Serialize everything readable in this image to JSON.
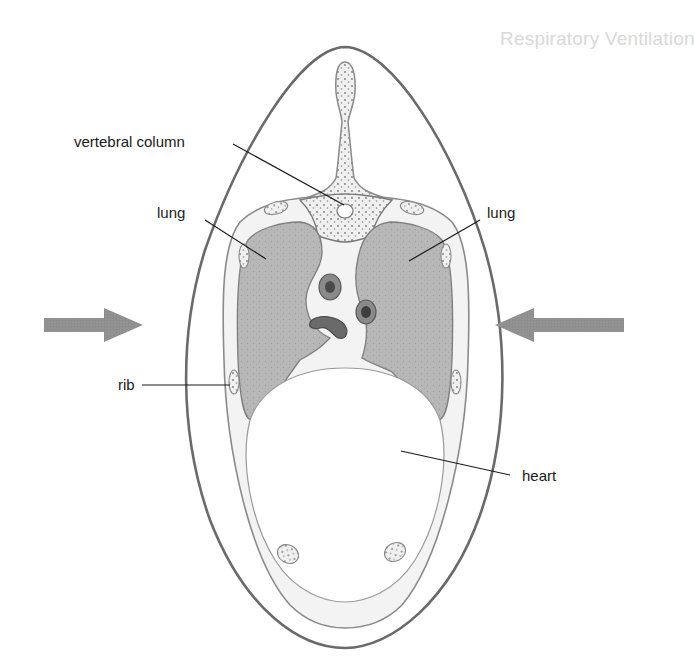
{
  "figure": {
    "labels": {
      "vertebral_column": "vertebral column",
      "lung_left": "lung",
      "lung_right": "lung",
      "rib": "rib",
      "heart": "heart"
    },
    "arrows": [
      {
        "name": "left-arrow",
        "direction": "right",
        "color": "#8c8c8c"
      },
      {
        "name": "right-arrow",
        "direction": "left",
        "color": "#8c8c8c"
      }
    ],
    "colors": {
      "outline": "#6e6e6e",
      "lung_fill": "#b9b9b9",
      "bone_fill": "#ececec",
      "arrow": "#8c8c8c",
      "leader_line": "#1a1a1a"
    }
  },
  "background_text": {
    "heading": "Respiratory Ventilation",
    "lines": [
      "This system is of the involuntary type — it is kept out",
      "...mechanical movement without conscious effort. It is not",
      "...conscious voluntary control, however, using the",
      "...range of smaller muscles...",
      "...is merely...",
      "During birth, the ... blood from the",
      "placenta is cut ... oxygen in the foetal",
      "system ... carbon dioxide until it causes a",
      "the level of carbon dioxide ... until it causes a",
      "marked change in pH of the blood. This increase",
      "acidity is recognised by the respiratory centre in the",
      "brain, which sends a series of impulses which produce",
      "inspiration and subsequent expiration then on. The",
      "...volume of respiration is controlled mainly from",
      "... through the autonomic nervous system.",
      "Inspiration"
    ]
  }
}
